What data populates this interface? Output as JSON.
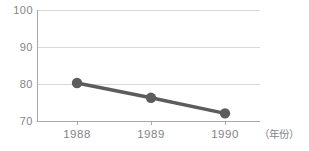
{
  "chart_data": {
    "type": "line",
    "categories": [
      "1988",
      "1989",
      "1990"
    ],
    "series": [
      {
        "name": "value",
        "values": [
          80.4,
          76.4,
          72.2
        ]
      }
    ],
    "title": "",
    "xlabel": "",
    "ylabel": "",
    "x_axis_unit_label": "（年份）",
    "yticks": [
      100,
      90,
      80,
      70
    ],
    "ylim": [
      70,
      100
    ],
    "grid": true,
    "legend": false,
    "marker": "circle",
    "colors": {
      "series": "#5b5c5e",
      "grid_line": "#d9d9d9",
      "axis_line": "#a8a8a8",
      "tick_text": "#828487"
    }
  }
}
